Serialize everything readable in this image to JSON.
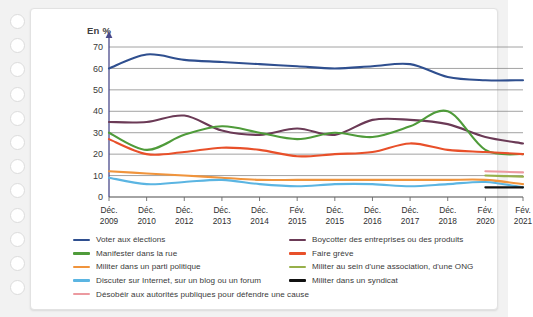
{
  "chart_data": {
    "type": "line",
    "title": "",
    "ylabel": "En %",
    "xlabel": "",
    "ylim": [
      0,
      70
    ],
    "yticks": [
      0,
      10,
      20,
      30,
      40,
      50,
      60,
      70
    ],
    "grid": true,
    "legend_position": "bottom",
    "categories": [
      "Déc. 2009",
      "Déc. 2010",
      "Déc. 2012",
      "Déc. 2013",
      "Déc. 2014",
      "Fév. 2015",
      "Déc. 2015",
      "Déc. 2016",
      "Déc. 2017",
      "Déc. 2018",
      "Fév. 2020",
      "Fév. 2021"
    ],
    "category_lines": [
      [
        "Déc.",
        "2009"
      ],
      [
        "Déc.",
        "2010"
      ],
      [
        "Déc.",
        "2012"
      ],
      [
        "Déc.",
        "2013"
      ],
      [
        "Déc.",
        "2014"
      ],
      [
        "Fév.",
        "2015"
      ],
      [
        "Déc.",
        "2015"
      ],
      [
        "Déc.",
        "2016"
      ],
      [
        "Déc.",
        "2017"
      ],
      [
        "Déc.",
        "2018"
      ],
      [
        "Fév.",
        "2020"
      ],
      [
        "Fév.",
        "2021"
      ]
    ],
    "series": [
      {
        "name": "Voter aux élections",
        "color": "#2f4f8f",
        "values": [
          60,
          66.5,
          64,
          63,
          62,
          61,
          60,
          61,
          62,
          56,
          54.5,
          54.5
        ]
      },
      {
        "name": "Boycotter des entreprises ou des produits",
        "color": "#6b3a56",
        "values": [
          35,
          35,
          38,
          31,
          29,
          32,
          29,
          36,
          36,
          34,
          28,
          25
        ]
      },
      {
        "name": "Manifester dans la rue",
        "color": "#4f9b3a",
        "values": [
          30,
          22,
          29,
          33,
          30,
          27,
          30,
          28,
          33,
          40,
          22,
          20
        ]
      },
      {
        "name": "Faire grève",
        "color": "#e8502a",
        "values": [
          27,
          20,
          21,
          23,
          22,
          19,
          20,
          21,
          25,
          22,
          21,
          20
        ]
      },
      {
        "name": "Militer dans un parti politique",
        "color": "#f0943c",
        "values": [
          12,
          11,
          10,
          9,
          8,
          8,
          8,
          8,
          8,
          8,
          8,
          6
        ]
      },
      {
        "name": "Militer au sein d'une association, d'une ONG",
        "color": "#97b04a",
        "values": [
          null,
          null,
          null,
          null,
          null,
          null,
          null,
          null,
          null,
          null,
          10,
          9.5
        ]
      },
      {
        "name": "Discuter sur Internet, sur un blog ou un forum",
        "color": "#5bb5e2",
        "values": [
          9,
          6,
          7,
          8,
          6,
          5,
          6,
          6,
          5,
          6,
          7,
          4.5
        ]
      },
      {
        "name": "Militer dans un syndicat",
        "color": "#111111",
        "values": [
          null,
          null,
          null,
          null,
          null,
          null,
          null,
          null,
          null,
          null,
          4.5,
          4.5
        ]
      },
      {
        "name": "Désobéir aux autorités publiques pour défendre une cause",
        "color": "#ec9aa0",
        "values": [
          null,
          null,
          null,
          null,
          null,
          null,
          null,
          null,
          null,
          null,
          12,
          11.5
        ]
      }
    ]
  },
  "legend": {
    "left": [
      {
        "label": "Voter aux élections",
        "color": "#2f4f8f",
        "icon": "legend-line-swatch"
      },
      {
        "label": "Manifester dans la rue",
        "color": "#4f9b3a",
        "icon": "legend-line-swatch"
      },
      {
        "label": "Militer dans un parti politique",
        "color": "#f0943c",
        "icon": "legend-line-swatch"
      },
      {
        "label": "Discuter sur Internet, sur un blog ou un forum",
        "color": "#5bb5e2",
        "icon": "legend-line-swatch"
      },
      {
        "label": "Désobéir aux autorités publiques pour défendre une cause",
        "color": "#ec9aa0",
        "icon": "legend-line-swatch"
      }
    ],
    "right": [
      {
        "label": "Boycotter des entreprises ou des produits",
        "color": "#6b3a56",
        "icon": "legend-line-swatch"
      },
      {
        "label": "Faire grève",
        "color": "#e8502a",
        "icon": "legend-line-swatch"
      },
      {
        "label": "Militer au sein d'une association, d'une ONG",
        "color": "#97b04a",
        "icon": "legend-line-swatch"
      },
      {
        "label": "Militer dans un syndicat",
        "color": "#111111",
        "icon": "legend-line-swatch"
      }
    ]
  },
  "decor": {
    "hole_count": 12,
    "hole_icon": "binder-hole-icon"
  }
}
